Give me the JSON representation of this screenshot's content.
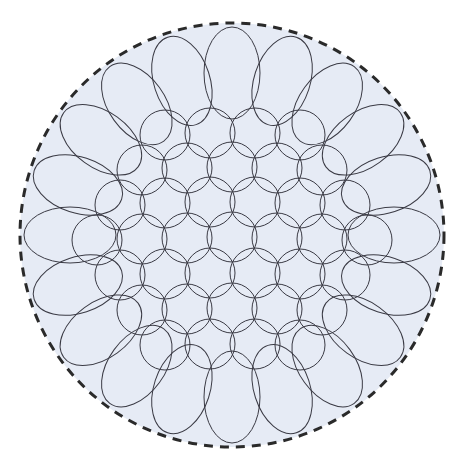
{
  "diagram": {
    "colors": {
      "background": "#ffffff",
      "boundary_fill": "#e6ebf5",
      "boundary_stroke": "#2a2a2a",
      "circle_stroke": "#3a3a44"
    },
    "boundary": {
      "cx": 232,
      "cy": 235,
      "r": 212,
      "dash": "9 7",
      "stroke_width": 3
    },
    "inner_circle_r": 25,
    "inner_circles": [
      [
        165,
        135
      ],
      [
        210,
        133
      ],
      [
        255,
        133
      ],
      [
        300,
        135
      ],
      [
        142,
        170
      ],
      [
        187,
        168
      ],
      [
        232,
        167
      ],
      [
        277,
        168
      ],
      [
        322,
        170
      ],
      [
        120,
        205
      ],
      [
        165,
        203
      ],
      [
        210,
        202
      ],
      [
        255,
        202
      ],
      [
        300,
        203
      ],
      [
        345,
        205
      ],
      [
        97,
        240
      ],
      [
        142,
        239
      ],
      [
        187,
        238
      ],
      [
        232,
        237
      ],
      [
        277,
        238
      ],
      [
        322,
        239
      ],
      [
        367,
        240
      ],
      [
        120,
        275
      ],
      [
        165,
        274
      ],
      [
        210,
        273
      ],
      [
        255,
        273
      ],
      [
        300,
        274
      ],
      [
        345,
        275
      ],
      [
        142,
        310
      ],
      [
        187,
        309
      ],
      [
        232,
        308
      ],
      [
        277,
        309
      ],
      [
        322,
        310
      ],
      [
        165,
        345
      ],
      [
        210,
        344
      ],
      [
        255,
        344
      ],
      [
        300,
        345
      ]
    ],
    "outer_ring": {
      "cx": 232,
      "cy": 235,
      "ring_r": 162,
      "rx": 28,
      "ry": 46,
      "count": 20,
      "start_angle_deg": -90
    }
  }
}
